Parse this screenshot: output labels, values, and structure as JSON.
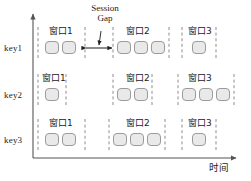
{
  "figure": {
    "type": "session-window-diagram",
    "axis": {
      "x_label": "时间",
      "y_label": "",
      "x_axis_y": 158,
      "y_axis_x": 33
    },
    "annotation": {
      "line1": "Session",
      "line2": "Gap",
      "pointer_target_x": 99,
      "span_from_x": 85,
      "span_to_x": 113
    },
    "colors": {
      "box_fill": "#e9e9e9",
      "box_stroke": "#9b9b9b",
      "dash_stroke": "#8d8d8d",
      "axis_stroke": "#555555",
      "text": "#222222"
    },
    "rows": [
      {
        "key": "key1",
        "label_y": 44,
        "box_y": 41,
        "windows": [
          {
            "label": "窗口1",
            "label_x": 49,
            "label_y": 27,
            "left": 38,
            "right": 85,
            "boxes_x": [
              45,
              62
            ]
          },
          {
            "label": "窗口2",
            "label_x": 126,
            "label_y": 27,
            "left": 113,
            "right": 169,
            "boxes_x": [
              117,
              134,
              151
            ]
          },
          {
            "label": "窗口3",
            "label_x": 188,
            "label_y": 27,
            "left": 182,
            "right": 216,
            "boxes_x": [
              192
            ]
          }
        ]
      },
      {
        "key": "key2",
        "label_y": 91,
        "box_y": 88,
        "windows": [
          {
            "label": "窗口1",
            "label_x": 42,
            "label_y": 74,
            "left": 38,
            "right": 66,
            "boxes_x": [
              45
            ]
          },
          {
            "label": "窗口2",
            "label_x": 126,
            "label_y": 74,
            "left": 113,
            "right": 152,
            "boxes_x": [
              117,
              134
            ]
          },
          {
            "label": "窗口3",
            "label_x": 188,
            "label_y": 74,
            "left": 178,
            "right": 234,
            "boxes_x": [
              182,
              199,
              216
            ]
          }
        ]
      },
      {
        "key": "key3",
        "label_y": 136,
        "box_y": 133,
        "windows": [
          {
            "label": "窗口1",
            "label_x": 49,
            "label_y": 119,
            "left": 38,
            "right": 85,
            "boxes_x": [
              45,
              62
            ]
          },
          {
            "label": "窗口2",
            "label_x": 126,
            "label_y": 119,
            "left": 109,
            "right": 165,
            "boxes_x": [
              113,
              130,
              147
            ]
          },
          {
            "label": "窗口3",
            "label_x": 188,
            "label_y": 119,
            "left": 182,
            "right": 216,
            "boxes_x": [
              192
            ]
          }
        ]
      }
    ],
    "key_labels": [
      {
        "text": "key1",
        "x": 4,
        "y": 44
      },
      {
        "text": "key2",
        "x": 4,
        "y": 91
      },
      {
        "text": "key3",
        "x": 4,
        "y": 136
      }
    ]
  }
}
